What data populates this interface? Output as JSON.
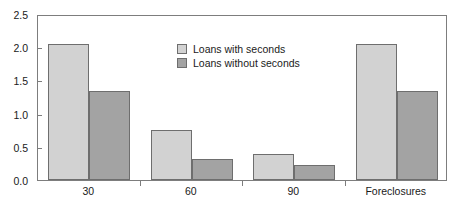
{
  "chart_data": {
    "type": "bar",
    "title": "",
    "subtitle": "",
    "xlabel": "",
    "ylabel": "",
    "categories": [
      "30",
      "60",
      "90",
      "Foreclosures"
    ],
    "series": [
      {
        "name": "Loans with seconds",
        "color": "#d2d2d2",
        "values": [
          2.05,
          0.75,
          0.39,
          2.05
        ]
      },
      {
        "name": "Loans without seconds",
        "color": "#a3a3a3",
        "values": [
          1.34,
          0.32,
          0.23,
          1.34
        ]
      }
    ],
    "ylim": [
      0.0,
      2.5
    ],
    "ytick_labels": [
      "0.0",
      "0.5",
      "1.0",
      "1.5",
      "2.0",
      "2.5"
    ],
    "ytick_values": [
      0.0,
      0.5,
      1.0,
      1.5,
      2.0,
      2.5
    ],
    "grid": false,
    "legend_position": "upper-center-left",
    "frame": true,
    "bar_border_color": "#6e6e6e",
    "axis_color": "#7d7d7d"
  },
  "figure": {
    "title_cropped": "",
    "background_color": "#ffffff",
    "text_color": "#1a1a1a"
  },
  "legend": {
    "entries": [
      "Loans with seconds",
      "Loans without seconds"
    ]
  }
}
